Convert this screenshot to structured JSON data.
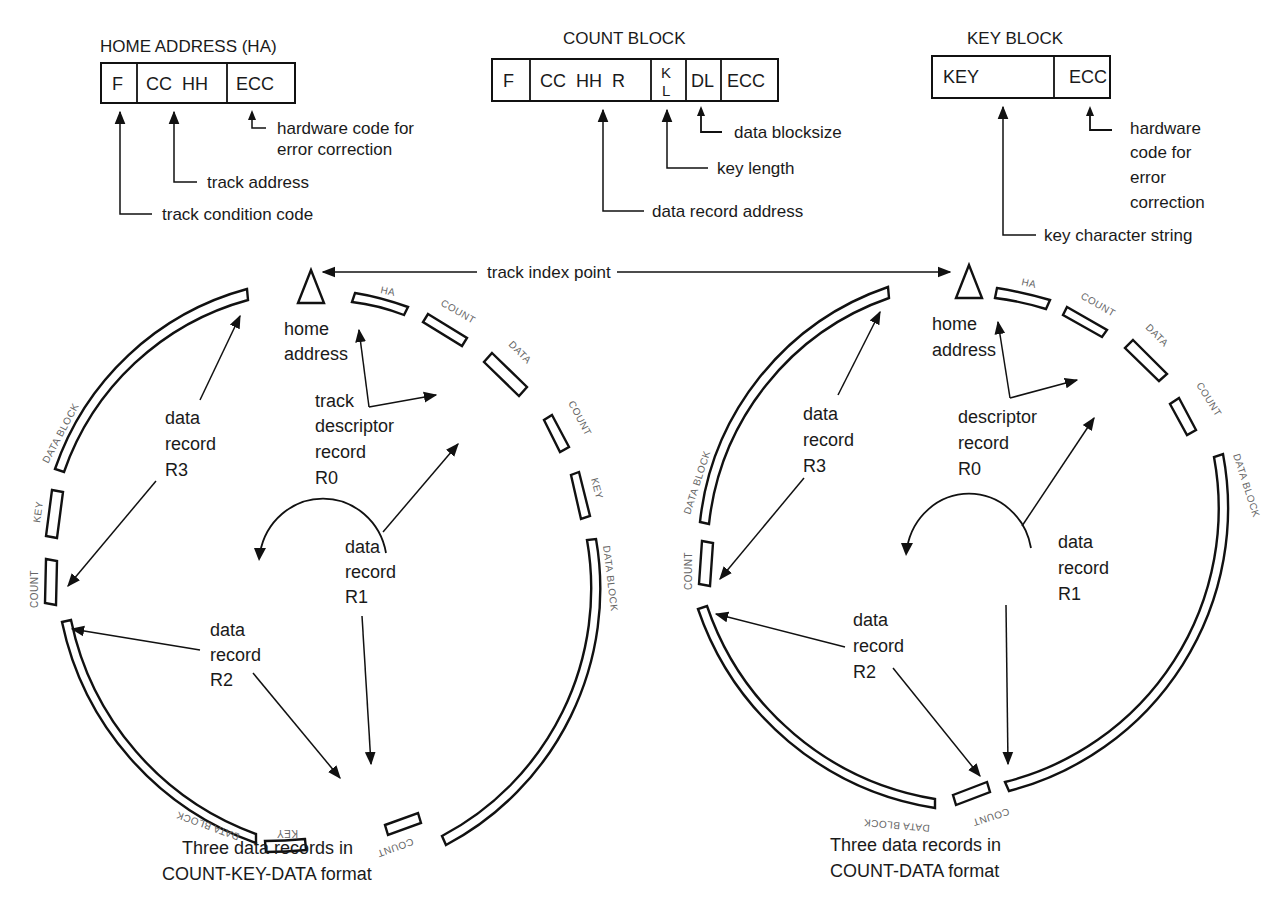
{
  "formats": {
    "home_address": {
      "title": "HOME ADDRESS (HA)",
      "fields": [
        "F",
        "CC  HH",
        "ECC"
      ],
      "annotations": {
        "ecc": [
          "hardware code for",
          "error correction"
        ],
        "cchh": "track address",
        "f": "track condition code"
      }
    },
    "count_block": {
      "title": "COUNT BLOCK",
      "fields": [
        "F",
        "CC  HH  R",
        "K",
        "L",
        "DL",
        "ECC"
      ],
      "annotations": {
        "dl": "data blocksize",
        "kl": "key length",
        "cchhr": "data record address"
      }
    },
    "key_block": {
      "title": "KEY BLOCK",
      "fields": [
        "KEY",
        "ECC"
      ],
      "annotations": {
        "ecc": [
          "hardware",
          "code for",
          "error",
          "correction"
        ],
        "key": "key character string"
      }
    }
  },
  "track_index_label": "track index point",
  "left_track": {
    "caption": [
      "Three data records in",
      "COUNT-KEY-DATA format"
    ],
    "segment_labels": {
      "ha": "HA",
      "count0": "COUNT",
      "data0": "DATA",
      "count1": "COUNT",
      "key1": "KEY",
      "data1": "DATA BLOCK",
      "count2": "COUNT",
      "key2": "KEY",
      "data2": "DATA BLOCK",
      "count3": "COUNT",
      "key3": "KEY",
      "data3": "DATA BLOCK"
    },
    "callouts": {
      "home_address": [
        "home",
        "address"
      ],
      "r0": [
        "track",
        "descriptor",
        "record",
        "R0"
      ],
      "r1": [
        "data",
        "record",
        "R1"
      ],
      "r2": [
        "data",
        "record",
        "R2"
      ],
      "r3": [
        "data",
        "record",
        "R3"
      ]
    }
  },
  "right_track": {
    "caption": [
      "Three data records in",
      "COUNT-DATA format"
    ],
    "segment_labels": {
      "ha": "HA",
      "count0": "COUNT",
      "data0": "DATA",
      "count1": "COUNT",
      "data1": "DATA BLOCK",
      "count2": "COUNT",
      "data2": "DATA BLOCK",
      "count3": "COUNT",
      "data3": "DATA BLOCK"
    },
    "callouts": {
      "home_address": [
        "home",
        "address"
      ],
      "r0": [
        "descriptor",
        "record",
        "R0"
      ],
      "r1": [
        "data",
        "record",
        "R1"
      ],
      "r2": [
        "data",
        "record",
        "R2"
      ],
      "r3": [
        "data",
        "record",
        "R3"
      ]
    }
  }
}
